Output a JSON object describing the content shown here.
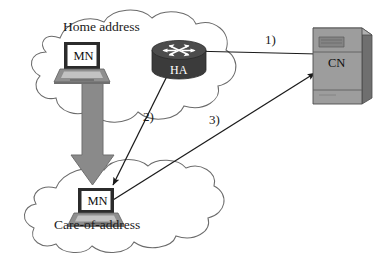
{
  "figure": {
    "type": "network-diagram",
    "width": 388,
    "height": 268,
    "background": "#ffffff"
  },
  "clouds": [
    {
      "id": "home-network",
      "label": "Home address",
      "label_x": 63,
      "label_y": 26,
      "bounds": {
        "x": 22,
        "y": 14,
        "width": 222,
        "height": 116
      }
    },
    {
      "id": "foreign-network",
      "label": "Care-of-address",
      "label_x": 54,
      "label_y": 224,
      "bounds": {
        "x": 20,
        "y": 164,
        "width": 230,
        "height": 86
      }
    }
  ],
  "nodes": [
    {
      "id": "mn-home",
      "icon": "laptop-icon",
      "label": "MN",
      "x": 72,
      "y": 42,
      "network": "home-network"
    },
    {
      "id": "ha-router",
      "icon": "router-icon",
      "label": "HA",
      "x": 155,
      "y": 40,
      "network": "home-network"
    },
    {
      "id": "cn-server",
      "icon": "server-icon",
      "label": "CN",
      "x": 330,
      "y": 30,
      "network": "internet"
    },
    {
      "id": "mn-foreign",
      "icon": "laptop-icon",
      "label": "MN",
      "x": 72,
      "y": 188,
      "network": "foreign-network"
    }
  ],
  "flows": [
    {
      "id": "flow-1",
      "label": "1)",
      "from": "cn-server",
      "to": "ha-router",
      "label_x": 265,
      "label_y": 38,
      "direction": "right-to-left"
    },
    {
      "id": "flow-2",
      "label": "2)",
      "from": "ha-router",
      "to": "mn-foreign",
      "label_x": 143,
      "label_y": 115,
      "direction": "down-left"
    },
    {
      "id": "flow-3",
      "label": "3)",
      "from": "mn-foreign",
      "to": "cn-server",
      "label_x": 209,
      "label_y": 118,
      "direction": "up-right"
    }
  ],
  "movement_arrow": {
    "id": "mn-move-arrow",
    "label": "",
    "from": "mn-home",
    "to": "mn-foreign",
    "color": "#8a8a8a",
    "direction": "down"
  },
  "colors": {
    "outline": "#6b6b6b",
    "line": "#1a1a1a",
    "text": "#1a1a1a",
    "arrow_fill": "#8a8a8a",
    "arrow_stroke": "#6e6e6e",
    "router_body": "#3d3d3d",
    "router_top": "#4a4a4a",
    "server_body": "#9b9b9b",
    "server_side": "#707070",
    "laptop_screen": "#ffffff",
    "laptop_bezel": "#2b2b2b",
    "laptop_base": "#a8a8a8"
  }
}
